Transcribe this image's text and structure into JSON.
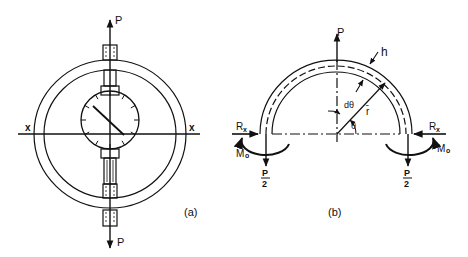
{
  "figure_a": {
    "caption": "(a)",
    "load_top": "P",
    "load_bottom": "P",
    "axis_left": "x",
    "axis_right": "x"
  },
  "figure_b": {
    "caption": "(b)",
    "load_top": "P",
    "thickness": "h",
    "angle_increment": "dθ",
    "mean_radius": "r̄",
    "angle": "θ",
    "reaction_left": "Rx",
    "reaction_right": "Rx",
    "reaction_sub": "x",
    "reaction_main": "R",
    "moment_main": "M",
    "moment_sub": "o",
    "half_load_num": "P",
    "half_load_den": "2"
  },
  "colors": {
    "ink": "#111111",
    "background": "#ffffff"
  }
}
